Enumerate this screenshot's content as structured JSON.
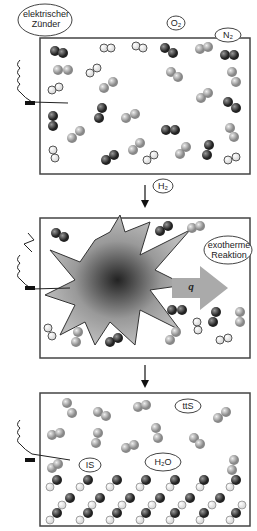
{
  "panels": [
    {
      "name": "before-ignition",
      "labels": {
        "igniter": "elektrischer Zünder",
        "o2": "O₂",
        "n2": "N₂",
        "h2": "H₂"
      }
    },
    {
      "name": "explosion",
      "labels": {
        "reaction": "exotherme Reaktion",
        "heat": "q"
      }
    },
    {
      "name": "after-reaction",
      "labels": {
        "ts1": "ttS",
        "ts2": "IS",
        "water": "H₂O"
      }
    }
  ],
  "colors": {
    "o2": "#3a3a3a",
    "n2": "#9a9a9a",
    "h2": "#ffffff",
    "frame": "#444444",
    "arrow": "#aaaaaa"
  }
}
